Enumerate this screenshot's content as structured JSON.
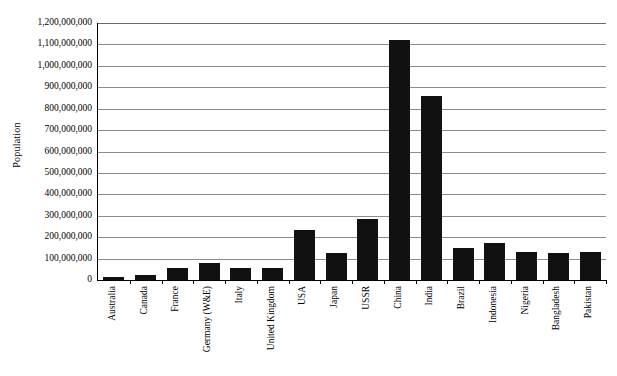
{
  "chart_data": {
    "type": "bar",
    "title": "",
    "xlabel": "",
    "ylabel": "Population",
    "ylim": [
      0,
      1200000000
    ],
    "ytick_step": 100000000,
    "grid": true,
    "legend": false,
    "bar_color": "#111111",
    "axis_color": "#000000",
    "gridline_color": "#8d8d8d",
    "categories": [
      "Australia",
      "Canada",
      "France",
      "Germany (W&E)",
      "Italy",
      "United Kingdom",
      "USA",
      "Japan",
      "USSR",
      "China",
      "India",
      "Brazil",
      "Indonesia",
      "Nigeria",
      "Bangladesh",
      "Pakistan"
    ],
    "values": [
      16000000,
      25000000,
      56000000,
      78000000,
      57000000,
      56000000,
      235000000,
      125000000,
      285000000,
      1120000000,
      860000000,
      150000000,
      175000000,
      130000000,
      128000000,
      132000000
    ],
    "ytick_labels": [
      "0",
      "100,000,000",
      "200,000,000",
      "300,000,000",
      "400,000,000",
      "500,000,000",
      "600,000,000",
      "700,000,000",
      "800,000,000",
      "900,000,000",
      "1,000,000,000",
      "1,100,000,000",
      "1,200,000,000"
    ],
    "ytick_values": [
      0,
      100000000,
      200000000,
      300000000,
      400000000,
      500000000,
      600000000,
      700000000,
      800000000,
      900000000,
      1000000000,
      1100000000,
      1200000000
    ]
  }
}
